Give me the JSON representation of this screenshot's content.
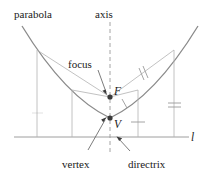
{
  "figure": {
    "background_color": "#ffffff",
    "curve_color": "#8a8a8a",
    "thin_line_color": "#b3b3b3",
    "label_color": "#1a1a1a"
  },
  "labels": {
    "parabola": "parabola",
    "axis": "axis",
    "focus": "focus",
    "focus_point": "F",
    "vertex_point": "V",
    "vertex": "vertex",
    "directrix": "directrix",
    "line": "l"
  },
  "points": {
    "focus": {
      "x": 110,
      "y": 97
    },
    "vertex": {
      "x": 110,
      "y": 118
    }
  },
  "geometry": {
    "directrix_line_y": 137,
    "axis_x": 110,
    "foot_points_x": [
      37,
      72,
      138,
      174
    ],
    "curve_points_x": [
      37,
      72,
      138,
      174
    ]
  },
  "tick_marks": {
    "double_tick_focal_chord_right": 2,
    "single_tick_focal_chord_lower": 1,
    "double_tick_vertical_right_outer": 2,
    "single_tick_vertical_right_inner": 1,
    "single_tick_vertical_left": 1
  }
}
